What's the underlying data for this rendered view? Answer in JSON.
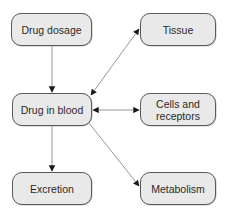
{
  "diagram": {
    "type": "flowchart",
    "nodes": [
      {
        "id": "drug_dosage",
        "label": "Drug dosage"
      },
      {
        "id": "tissue",
        "label": "Tissue"
      },
      {
        "id": "drug_in_blood",
        "label": "Drug in blood"
      },
      {
        "id": "cells_receptors",
        "label": "Cells and\nreceptors"
      },
      {
        "id": "excretion",
        "label": "Excretion"
      },
      {
        "id": "metabolism",
        "label": "Metabolism"
      }
    ],
    "edges": [
      {
        "from": "drug_dosage",
        "to": "drug_in_blood",
        "direction": "forward"
      },
      {
        "from": "drug_in_blood",
        "to": "tissue",
        "direction": "both"
      },
      {
        "from": "drug_in_blood",
        "to": "cells_receptors",
        "direction": "both"
      },
      {
        "from": "drug_in_blood",
        "to": "excretion",
        "direction": "forward"
      },
      {
        "from": "drug_in_blood",
        "to": "metabolism",
        "direction": "forward"
      }
    ],
    "colors": {
      "node_fill": "#e9e9e9",
      "node_border": "#5a5a5a",
      "edge": "#8a8a8a",
      "arrowhead": "#1a1a1a",
      "text": "#2a2a2a"
    }
  }
}
